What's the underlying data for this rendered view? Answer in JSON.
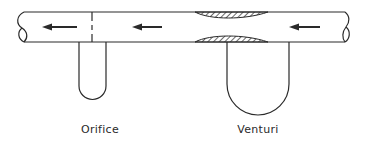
{
  "diagram": {
    "title": "",
    "colors": {
      "stroke": "#2a2a2a",
      "background": "#ffffff"
    },
    "pipe": {
      "flow_direction": "right-to-left",
      "arrows": [
        {
          "id": "arrow-left",
          "x1": 77,
          "x2": 42,
          "y": 27
        },
        {
          "id": "arrow-middle",
          "x1": 162,
          "x2": 132,
          "y": 27
        },
        {
          "id": "arrow-right",
          "x1": 320,
          "x2": 289,
          "y": 27
        }
      ]
    },
    "meters": [
      {
        "id": "orifice",
        "label": "Orifice",
        "label_x": 100,
        "label_y": 123
      },
      {
        "id": "venturi",
        "label": "Venturi",
        "label_x": 258,
        "label_y": 123
      }
    ]
  }
}
